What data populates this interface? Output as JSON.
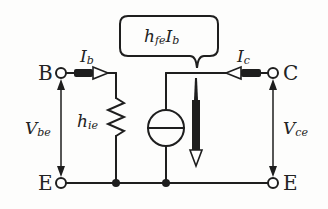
{
  "diagram": {
    "terminals": {
      "base": "B",
      "collector": "C",
      "emitter_left": "E",
      "emitter_right": "E"
    },
    "labels": {
      "ib_main": "I",
      "ib_sub": "b",
      "ic_main": "I",
      "ic_sub": "c",
      "vbe_main": "V",
      "vbe_sub": "be",
      "vce_main": "V",
      "vce_sub": "ce",
      "hie_main": "h",
      "hie_sub": "ie",
      "callout_h": "h",
      "callout_fe": "fe",
      "callout_I": "I",
      "callout_b": "b"
    },
    "components": [
      {
        "type": "resistor",
        "label": "hie",
        "between": "base-emitter"
      },
      {
        "type": "current-source",
        "label": "hfe·Ib",
        "between": "collector-emitter"
      }
    ],
    "colors": {
      "line": "#1e1e1e",
      "background": "#fdfdfc"
    }
  }
}
